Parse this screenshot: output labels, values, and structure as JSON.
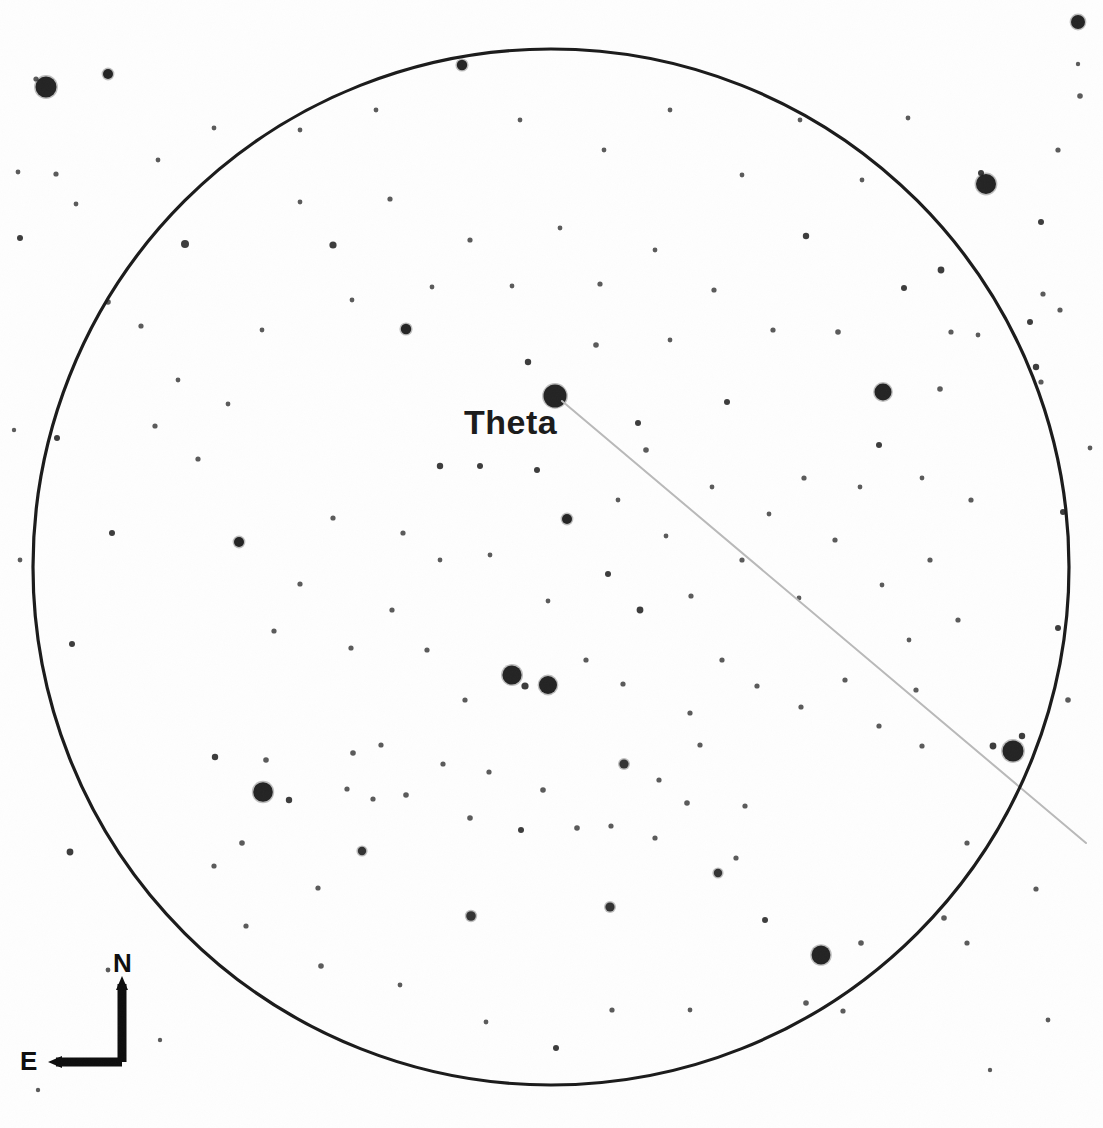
{
  "chart_type": "star-chart",
  "canvas": {
    "width": 1103,
    "height": 1128,
    "background": "#fefefe"
  },
  "labels": {
    "theta": "Theta",
    "north": "N",
    "east": "E"
  },
  "colors": {
    "star": "#1a1a1a",
    "circle_outline": "#1a1a1a",
    "pointer_line": "#b9b9b9",
    "compass": "#0d0d0d",
    "background": "#fefefe"
  },
  "chart_data": {
    "type": "scatter",
    "title": "",
    "xlabel": "",
    "ylabel": "",
    "grid": false,
    "legend": null,
    "field_of_view": {
      "shape": "circle",
      "center_x": 551,
      "center_y": 567,
      "radius": 518,
      "stroke_width": 3.2,
      "note": "Telescope / eyepiece field-of-view circle"
    },
    "orientation": {
      "north": "up",
      "east": "left",
      "marker": {
        "corner_x": 122,
        "corner_y": 1062,
        "arm_up_to_y": 984,
        "arm_left_to_x": 56
      }
    },
    "annotations": [
      {
        "name": "theta-label",
        "text": "Theta",
        "x": 464,
        "y": 405,
        "font_size": 34,
        "bold": true
      }
    ],
    "pointer_line": {
      "name": "theta-pointer-line",
      "x1": 562,
      "y1": 401,
      "x2": 1086,
      "y2": 843,
      "color": "#b9b9b9",
      "width": 2
    },
    "labeled_stars": [
      {
        "label": "Theta",
        "x": 555,
        "y": 396,
        "r": 11.5,
        "mag_class": "bright"
      }
    ],
    "stars": [
      {
        "x": 46,
        "y": 87,
        "r": 10.5
      },
      {
        "x": 108,
        "y": 74,
        "r": 5.0
      },
      {
        "x": 36,
        "y": 79,
        "r": 2.6
      },
      {
        "x": 986,
        "y": 184,
        "r": 10.0
      },
      {
        "x": 981,
        "y": 173,
        "r": 3.0
      },
      {
        "x": 1078,
        "y": 22,
        "r": 7.0,
        "shape": "smudge"
      },
      {
        "x": 1078,
        "y": 64,
        "r": 2.2
      },
      {
        "x": 1080,
        "y": 96,
        "r": 2.8
      },
      {
        "x": 883,
        "y": 392,
        "r": 8.5
      },
      {
        "x": 1013,
        "y": 751,
        "r": 10.5
      },
      {
        "x": 1022,
        "y": 736,
        "r": 3.2
      },
      {
        "x": 993,
        "y": 746,
        "r": 3.4
      },
      {
        "x": 263,
        "y": 792,
        "r": 9.8
      },
      {
        "x": 512,
        "y": 675,
        "r": 9.6
      },
      {
        "x": 548,
        "y": 685,
        "r": 9.0
      },
      {
        "x": 525,
        "y": 686,
        "r": 3.6
      },
      {
        "x": 821,
        "y": 955,
        "r": 9.4
      },
      {
        "x": 406,
        "y": 329,
        "r": 5.2
      },
      {
        "x": 462,
        "y": 65,
        "r": 5.2
      },
      {
        "x": 239,
        "y": 542,
        "r": 5.0
      },
      {
        "x": 567,
        "y": 519,
        "r": 5.0
      },
      {
        "x": 624,
        "y": 764,
        "r": 4.6
      },
      {
        "x": 471,
        "y": 916,
        "r": 4.8
      },
      {
        "x": 610,
        "y": 907,
        "r": 4.6
      },
      {
        "x": 718,
        "y": 873,
        "r": 4.2
      },
      {
        "x": 362,
        "y": 851,
        "r": 4.2
      },
      {
        "x": 185,
        "y": 244,
        "r": 4.0
      },
      {
        "x": 333,
        "y": 245,
        "r": 3.6
      },
      {
        "x": 806,
        "y": 236,
        "r": 3.2
      },
      {
        "x": 941,
        "y": 270,
        "r": 3.4
      },
      {
        "x": 904,
        "y": 288,
        "r": 3.0
      },
      {
        "x": 640,
        "y": 610,
        "r": 3.4
      },
      {
        "x": 608,
        "y": 574,
        "r": 3.0
      },
      {
        "x": 440,
        "y": 466,
        "r": 3.2
      },
      {
        "x": 480,
        "y": 466,
        "r": 3.0
      },
      {
        "x": 537,
        "y": 470,
        "r": 3.0
      },
      {
        "x": 528,
        "y": 362,
        "r": 3.2
      },
      {
        "x": 596,
        "y": 345,
        "r": 2.8
      },
      {
        "x": 638,
        "y": 423,
        "r": 3.0
      },
      {
        "x": 646,
        "y": 450,
        "r": 2.8
      },
      {
        "x": 727,
        "y": 402,
        "r": 3.0
      },
      {
        "x": 838,
        "y": 332,
        "r": 2.8
      },
      {
        "x": 879,
        "y": 445,
        "r": 3.0
      },
      {
        "x": 940,
        "y": 389,
        "r": 2.8
      },
      {
        "x": 1041,
        "y": 222,
        "r": 3.0
      },
      {
        "x": 1030,
        "y": 322,
        "r": 3.0
      },
      {
        "x": 1036,
        "y": 367,
        "r": 3.2
      },
      {
        "x": 1041,
        "y": 382,
        "r": 2.6
      },
      {
        "x": 1043,
        "y": 294,
        "r": 2.6
      },
      {
        "x": 1060,
        "y": 310,
        "r": 2.6
      },
      {
        "x": 1063,
        "y": 512,
        "r": 3.0
      },
      {
        "x": 1058,
        "y": 628,
        "r": 3.0
      },
      {
        "x": 1068,
        "y": 700,
        "r": 2.8
      },
      {
        "x": 1058,
        "y": 150,
        "r": 2.6
      },
      {
        "x": 951,
        "y": 332,
        "r": 2.6
      },
      {
        "x": 1090,
        "y": 448,
        "r": 2.4
      },
      {
        "x": 978,
        "y": 335,
        "r": 2.4
      },
      {
        "x": 20,
        "y": 238,
        "r": 3.0
      },
      {
        "x": 18,
        "y": 172,
        "r": 2.4
      },
      {
        "x": 56,
        "y": 174,
        "r": 2.6
      },
      {
        "x": 57,
        "y": 438,
        "r": 3.0
      },
      {
        "x": 76,
        "y": 204,
        "r": 2.4
      },
      {
        "x": 112,
        "y": 533,
        "r": 3.0
      },
      {
        "x": 72,
        "y": 644,
        "r": 3.0
      },
      {
        "x": 70,
        "y": 852,
        "r": 3.4
      },
      {
        "x": 108,
        "y": 302,
        "r": 2.8
      },
      {
        "x": 141,
        "y": 326,
        "r": 2.6
      },
      {
        "x": 155,
        "y": 426,
        "r": 2.6
      },
      {
        "x": 198,
        "y": 459,
        "r": 2.6
      },
      {
        "x": 215,
        "y": 757,
        "r": 3.2
      },
      {
        "x": 266,
        "y": 760,
        "r": 2.8
      },
      {
        "x": 289,
        "y": 800,
        "r": 3.2
      },
      {
        "x": 242,
        "y": 843,
        "r": 2.8
      },
      {
        "x": 214,
        "y": 866,
        "r": 2.6
      },
      {
        "x": 246,
        "y": 926,
        "r": 2.6
      },
      {
        "x": 318,
        "y": 888,
        "r": 2.6
      },
      {
        "x": 321,
        "y": 966,
        "r": 2.8
      },
      {
        "x": 353,
        "y": 753,
        "r": 2.8
      },
      {
        "x": 347,
        "y": 789,
        "r": 2.6
      },
      {
        "x": 373,
        "y": 799,
        "r": 2.6
      },
      {
        "x": 381,
        "y": 745,
        "r": 2.6
      },
      {
        "x": 406,
        "y": 795,
        "r": 2.8
      },
      {
        "x": 443,
        "y": 764,
        "r": 2.6
      },
      {
        "x": 470,
        "y": 818,
        "r": 2.8
      },
      {
        "x": 489,
        "y": 772,
        "r": 2.6
      },
      {
        "x": 521,
        "y": 830,
        "r": 3.0
      },
      {
        "x": 543,
        "y": 790,
        "r": 2.8
      },
      {
        "x": 577,
        "y": 828,
        "r": 2.8
      },
      {
        "x": 611,
        "y": 826,
        "r": 2.6
      },
      {
        "x": 655,
        "y": 838,
        "r": 2.6
      },
      {
        "x": 659,
        "y": 780,
        "r": 2.6
      },
      {
        "x": 687,
        "y": 803,
        "r": 2.8
      },
      {
        "x": 700,
        "y": 745,
        "r": 2.6
      },
      {
        "x": 745,
        "y": 806,
        "r": 2.6
      },
      {
        "x": 736,
        "y": 858,
        "r": 2.6
      },
      {
        "x": 765,
        "y": 920,
        "r": 3.0
      },
      {
        "x": 806,
        "y": 1003,
        "r": 2.8
      },
      {
        "x": 843,
        "y": 1011,
        "r": 2.6
      },
      {
        "x": 861,
        "y": 943,
        "r": 2.8
      },
      {
        "x": 944,
        "y": 918,
        "r": 2.8
      },
      {
        "x": 967,
        "y": 943,
        "r": 2.6
      },
      {
        "x": 1036,
        "y": 889,
        "r": 2.6
      },
      {
        "x": 967,
        "y": 843,
        "r": 2.6
      },
      {
        "x": 922,
        "y": 746,
        "r": 2.6
      },
      {
        "x": 916,
        "y": 690,
        "r": 2.6
      },
      {
        "x": 879,
        "y": 726,
        "r": 2.6
      },
      {
        "x": 845,
        "y": 680,
        "r": 2.6
      },
      {
        "x": 801,
        "y": 707,
        "r": 2.6
      },
      {
        "x": 757,
        "y": 686,
        "r": 2.6
      },
      {
        "x": 722,
        "y": 660,
        "r": 2.6
      },
      {
        "x": 690,
        "y": 713,
        "r": 2.6
      },
      {
        "x": 623,
        "y": 684,
        "r": 2.6
      },
      {
        "x": 586,
        "y": 660,
        "r": 2.6
      },
      {
        "x": 465,
        "y": 700,
        "r": 2.6
      },
      {
        "x": 427,
        "y": 650,
        "r": 2.6
      },
      {
        "x": 392,
        "y": 610,
        "r": 2.6
      },
      {
        "x": 351,
        "y": 648,
        "r": 2.6
      },
      {
        "x": 300,
        "y": 584,
        "r": 2.6
      },
      {
        "x": 274,
        "y": 631,
        "r": 2.6
      },
      {
        "x": 333,
        "y": 518,
        "r": 2.6
      },
      {
        "x": 403,
        "y": 533,
        "r": 2.6
      },
      {
        "x": 440,
        "y": 560,
        "r": 2.4
      },
      {
        "x": 490,
        "y": 555,
        "r": 2.4
      },
      {
        "x": 548,
        "y": 601,
        "r": 2.4
      },
      {
        "x": 691,
        "y": 596,
        "r": 2.6
      },
      {
        "x": 742,
        "y": 560,
        "r": 2.6
      },
      {
        "x": 799,
        "y": 598,
        "r": 2.4
      },
      {
        "x": 835,
        "y": 540,
        "r": 2.6
      },
      {
        "x": 882,
        "y": 585,
        "r": 2.4
      },
      {
        "x": 930,
        "y": 560,
        "r": 2.6
      },
      {
        "x": 958,
        "y": 620,
        "r": 2.6
      },
      {
        "x": 909,
        "y": 640,
        "r": 2.4
      },
      {
        "x": 971,
        "y": 500,
        "r": 2.6
      },
      {
        "x": 922,
        "y": 478,
        "r": 2.4
      },
      {
        "x": 860,
        "y": 487,
        "r": 2.4
      },
      {
        "x": 804,
        "y": 478,
        "r": 2.6
      },
      {
        "x": 769,
        "y": 514,
        "r": 2.4
      },
      {
        "x": 712,
        "y": 487,
        "r": 2.4
      },
      {
        "x": 666,
        "y": 536,
        "r": 2.4
      },
      {
        "x": 618,
        "y": 500,
        "r": 2.4
      },
      {
        "x": 773,
        "y": 330,
        "r": 2.6
      },
      {
        "x": 714,
        "y": 290,
        "r": 2.6
      },
      {
        "x": 670,
        "y": 340,
        "r": 2.4
      },
      {
        "x": 655,
        "y": 250,
        "r": 2.4
      },
      {
        "x": 600,
        "y": 284,
        "r": 2.6
      },
      {
        "x": 560,
        "y": 228,
        "r": 2.4
      },
      {
        "x": 512,
        "y": 286,
        "r": 2.4
      },
      {
        "x": 470,
        "y": 240,
        "r": 2.6
      },
      {
        "x": 432,
        "y": 287,
        "r": 2.4
      },
      {
        "x": 390,
        "y": 199,
        "r": 2.6
      },
      {
        "x": 352,
        "y": 300,
        "r": 2.4
      },
      {
        "x": 300,
        "y": 202,
        "r": 2.4
      },
      {
        "x": 262,
        "y": 330,
        "r": 2.4
      },
      {
        "x": 228,
        "y": 404,
        "r": 2.4
      },
      {
        "x": 178,
        "y": 380,
        "r": 2.4
      },
      {
        "x": 158,
        "y": 160,
        "r": 2.4
      },
      {
        "x": 214,
        "y": 128,
        "r": 2.4
      },
      {
        "x": 300,
        "y": 130,
        "r": 2.4
      },
      {
        "x": 376,
        "y": 110,
        "r": 2.4
      },
      {
        "x": 520,
        "y": 120,
        "r": 2.4
      },
      {
        "x": 604,
        "y": 150,
        "r": 2.4
      },
      {
        "x": 670,
        "y": 110,
        "r": 2.4
      },
      {
        "x": 742,
        "y": 175,
        "r": 2.4
      },
      {
        "x": 800,
        "y": 120,
        "r": 2.4
      },
      {
        "x": 862,
        "y": 180,
        "r": 2.4
      },
      {
        "x": 908,
        "y": 118,
        "r": 2.4
      },
      {
        "x": 556,
        "y": 1048,
        "r": 3.0
      },
      {
        "x": 612,
        "y": 1010,
        "r": 2.6
      },
      {
        "x": 486,
        "y": 1022,
        "r": 2.4
      },
      {
        "x": 400,
        "y": 985,
        "r": 2.4
      },
      {
        "x": 690,
        "y": 1010,
        "r": 2.4
      },
      {
        "x": 108,
        "y": 970,
        "r": 2.4
      },
      {
        "x": 160,
        "y": 1040,
        "r": 2.2
      },
      {
        "x": 38,
        "y": 1090,
        "r": 2.2
      },
      {
        "x": 1048,
        "y": 1020,
        "r": 2.4
      },
      {
        "x": 990,
        "y": 1070,
        "r": 2.2
      },
      {
        "x": 20,
        "y": 560,
        "r": 2.4
      },
      {
        "x": 14,
        "y": 430,
        "r": 2.2
      }
    ]
  }
}
